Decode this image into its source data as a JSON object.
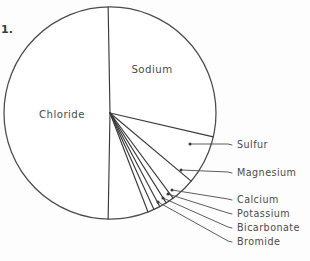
{
  "figure": {
    "number_label": "1.",
    "background_color": "#fdfdfd",
    "line_color": "#3a3a3a",
    "text_color": "#4b4b4b"
  },
  "geometry": {
    "center_x": 110,
    "center_y": 113,
    "radius": 106
  },
  "interior_labels": {
    "chloride": "Chloride",
    "sodium": "Sodium"
  },
  "callouts": [
    {
      "label": "Sulfur",
      "text_x": 237,
      "text_y": 148,
      "dot_x": 190,
      "dot_y": 144,
      "elbow_x": 228,
      "elbow_y": 144
    },
    {
      "label": "Magnesium",
      "text_x": 237,
      "text_y": 176,
      "dot_x": 181,
      "dot_y": 170,
      "elbow_x": 228,
      "elbow_y": 172
    },
    {
      "label": "Calcium",
      "text_x": 237,
      "text_y": 203,
      "dot_x": 172,
      "dot_y": 190,
      "elbow_x": 228,
      "elbow_y": 199
    },
    {
      "label": "Potassium",
      "text_x": 237,
      "text_y": 217,
      "dot_x": 168,
      "dot_y": 194,
      "elbow_x": 228,
      "elbow_y": 213
    },
    {
      "label": "Bicarbonate",
      "text_x": 237,
      "text_y": 231,
      "dot_x": 163,
      "dot_y": 198,
      "elbow_x": 228,
      "elbow_y": 227
    },
    {
      "label": "Bromide",
      "text_x": 237,
      "text_y": 245,
      "dot_x": 158,
      "dot_y": 202,
      "elbow_x": 228,
      "elbow_y": 241
    }
  ],
  "chart_data": {
    "type": "pie",
    "title": "",
    "subtitle": "",
    "xlabel": "",
    "ylabel": "",
    "legend_position": "callout-labels-right",
    "grid": false,
    "total_percent": 100,
    "units": "percent of dissolved solids",
    "labels": [
      "Chloride",
      "Sodium",
      "Sulfur",
      "Magnesium",
      "Calcium",
      "Potassium",
      "Bicarbonate",
      "Bromide"
    ],
    "values": [
      55.0,
      30.6,
      7.7,
      3.7,
      1.2,
      1.1,
      0.4,
      0.3
    ],
    "slices": [
      {
        "name": "Chloride",
        "value": 55.0,
        "start_angle_deg": 181,
        "end_angle_deg": 359,
        "label_placement": "inside",
        "label_x": 62,
        "label_y": 118
      },
      {
        "name": "Sodium",
        "value": 30.6,
        "start_angle_deg": 359,
        "end_angle_deg": 103,
        "label_placement": "inside",
        "label_x": 152,
        "label_y": 73
      },
      {
        "name": "Sulfur",
        "value": 7.7,
        "start_angle_deg": 103,
        "end_angle_deg": 130,
        "label_placement": "callout"
      },
      {
        "name": "Magnesium",
        "value": 3.7,
        "start_angle_deg": 130,
        "end_angle_deg": 143.5,
        "label_placement": "callout"
      },
      {
        "name": "Calcium",
        "value": 1.2,
        "start_angle_deg": 143.5,
        "end_angle_deg": 148,
        "label_placement": "callout"
      },
      {
        "name": "Potassium",
        "value": 1.1,
        "start_angle_deg": 148,
        "end_angle_deg": 152,
        "label_placement": "callout"
      },
      {
        "name": "Bicarbonate",
        "value": 0.4,
        "start_angle_deg": 152,
        "end_angle_deg": 155.5,
        "label_placement": "callout"
      },
      {
        "name": "Bromide",
        "value": 0.3,
        "start_angle_deg": 155.5,
        "end_angle_deg": 159,
        "label_placement": "callout"
      }
    ],
    "colors": [
      "#ffffff",
      "#ffffff",
      "#ffffff",
      "#ffffff",
      "#ffffff",
      "#ffffff",
      "#ffffff",
      "#ffffff"
    ],
    "stroke_color": "#3a3a3a"
  }
}
